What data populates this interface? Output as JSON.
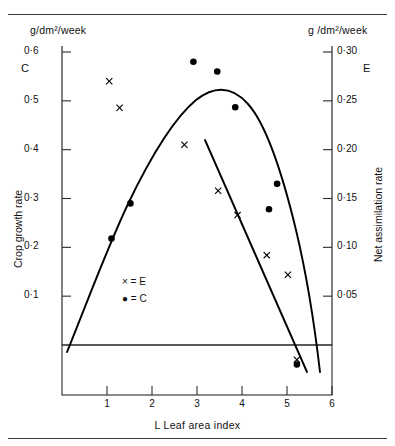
{
  "figure": {
    "unit_left": "g/dm²/week",
    "unit_right": "g /dm²/week",
    "symbol_left": "C",
    "symbol_right": "E"
  },
  "legend": {
    "entries": [
      {
        "marker": "×",
        "text": "× = E"
      },
      {
        "marker": "●",
        "text": "● = C"
      }
    ],
    "e_label": "× = E",
    "c_label": "● = C"
  },
  "chart_data": {
    "type": "scatter",
    "title": "",
    "xlabel": "L  Leaf area index",
    "ylabel": "Crop growth rate",
    "y2label": "Net assimilation rate",
    "xlim": [
      0,
      6
    ],
    "ylim": [
      -0.06,
      0.62
    ],
    "y2lim": [
      -0.03,
      0.31
    ],
    "grid": false,
    "legend_position": "inside-lower-left",
    "xticks": [
      1,
      2,
      3,
      4,
      5,
      6
    ],
    "xticklabels": [
      "1",
      "2",
      "3",
      "4",
      "5",
      "6"
    ],
    "yticks": [
      0.1,
      0.2,
      0.3,
      0.4,
      0.5,
      0.6
    ],
    "yticklabels": [
      "0·1",
      "0·2",
      "0·3",
      "0·4",
      "0·5",
      "0·6"
    ],
    "y2ticks": [
      0.05,
      0.1,
      0.15,
      0.2,
      0.25,
      0.3
    ],
    "y2ticklabels": [
      "0·05",
      "0·10",
      "0·15",
      "0·20",
      "0·25",
      "0·30"
    ],
    "series": [
      {
        "name": "C",
        "axis": "left",
        "marker": "filled-circle",
        "points": [
          {
            "x": 1.1,
            "y": 0.218
          },
          {
            "x": 1.52,
            "y": 0.29
          },
          {
            "x": 2.92,
            "y": 0.58
          },
          {
            "x": 3.45,
            "y": 0.56
          },
          {
            "x": 3.85,
            "y": 0.487
          },
          {
            "x": 4.78,
            "y": 0.33
          },
          {
            "x": 4.6,
            "y": 0.278
          },
          {
            "x": 5.22,
            "y": -0.04
          }
        ]
      },
      {
        "name": "E",
        "axis": "right",
        "marker": "cross",
        "points": [
          {
            "x": 1.05,
            "y": 0.27
          },
          {
            "x": 1.28,
            "y": 0.243
          },
          {
            "x": 2.72,
            "y": 0.205
          },
          {
            "x": 3.47,
            "y": 0.158
          },
          {
            "x": 3.9,
            "y": 0.133
          },
          {
            "x": 4.55,
            "y": 0.092
          },
          {
            "x": 5.02,
            "y": 0.072
          },
          {
            "x": 5.22,
            "y": -0.015
          }
        ]
      },
      {
        "name": "C fitted curve",
        "axis": "left",
        "type": "curve",
        "description": "parabolic crop growth rate curve peaking near L = 3"
      },
      {
        "name": "E fitted line",
        "axis": "right",
        "type": "line",
        "description": "straight declining net assimilation rate line"
      }
    ]
  }
}
